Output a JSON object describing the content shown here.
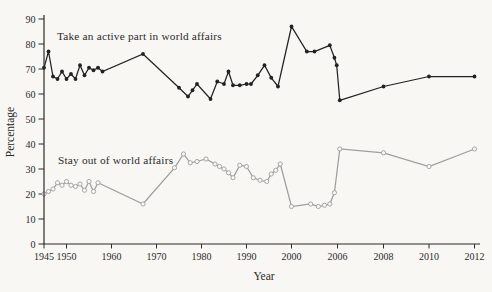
{
  "figure": {
    "background_color": "#f8f7f4",
    "axis_color": "#2b2b2b"
  },
  "chart_data": {
    "type": "line",
    "title": "",
    "xlabel": "Year",
    "ylabel": "Percentage",
    "ylim": [
      0,
      90
    ],
    "grid": false,
    "legend_position": "inline-annotations",
    "x_axis_note": "linear year spacing 1945-2000, compressed equal spacing for 2006, 2008, 2010, 2012",
    "y_ticks": [
      0,
      10,
      20,
      30,
      40,
      50,
      60,
      70,
      80,
      90
    ],
    "x_ticks": [
      1945,
      1950,
      1960,
      1970,
      1980,
      1990,
      2000,
      2006,
      2008,
      2010,
      2012
    ],
    "annotations": [
      {
        "text": "Take an active part in world affairs",
        "x": 57,
        "y": 40
      },
      {
        "text": "Stay out of world affairs",
        "x": 58,
        "y": 164
      }
    ],
    "series": [
      {
        "name": "Take an active part in world affairs",
        "color": "#222222",
        "marker": "filled-circle",
        "points": [
          [
            1945,
            70.5
          ],
          [
            1946,
            77
          ],
          [
            1947,
            67
          ],
          [
            1948,
            66
          ],
          [
            1949,
            69
          ],
          [
            1950,
            66
          ],
          [
            1951,
            68
          ],
          [
            1952,
            66
          ],
          [
            1953,
            71.5
          ],
          [
            1954,
            67.5
          ],
          [
            1955,
            70.5
          ],
          [
            1956,
            69.5
          ],
          [
            1957,
            70.5
          ],
          [
            1958,
            69
          ],
          [
            1967,
            76
          ],
          [
            1975,
            62.5
          ],
          [
            1977,
            59
          ],
          [
            1978,
            61.5
          ],
          [
            1979,
            64
          ],
          [
            1982,
            58
          ],
          [
            1983.5,
            65
          ],
          [
            1985,
            64
          ],
          [
            1986,
            69
          ],
          [
            1987,
            63.5
          ],
          [
            1988.5,
            63.5
          ],
          [
            1990,
            64
          ],
          [
            1991,
            64
          ],
          [
            1992.5,
            67.5
          ],
          [
            1994,
            71.5
          ],
          [
            1995.5,
            66.5
          ],
          [
            1997,
            63
          ],
          [
            2000,
            87
          ],
          [
            2002,
            77
          ],
          [
            2003,
            77
          ],
          [
            2005,
            79.5
          ],
          [
            2005.6,
            74.5
          ],
          [
            2005.9,
            71.5
          ],
          [
            2006.1,
            57.5
          ],
          [
            2008,
            63
          ],
          [
            2010,
            67
          ],
          [
            2012,
            67
          ]
        ]
      },
      {
        "name": "Stay out of world affairs",
        "color": "#9e9e9e",
        "marker": "open-circle",
        "points": [
          [
            1945,
            20
          ],
          [
            1946,
            21
          ],
          [
            1947,
            22
          ],
          [
            1948,
            24.5
          ],
          [
            1949,
            23.5
          ],
          [
            1950,
            25
          ],
          [
            1951,
            23.5
          ],
          [
            1952,
            23
          ],
          [
            1953,
            24
          ],
          [
            1954,
            21.5
          ],
          [
            1955,
            25
          ],
          [
            1956,
            21
          ],
          [
            1957,
            24.5
          ],
          [
            1967,
            16
          ],
          [
            1974,
            30.5
          ],
          [
            1976,
            36
          ],
          [
            1977.5,
            32.5
          ],
          [
            1979,
            33
          ],
          [
            1981,
            34
          ],
          [
            1983,
            32
          ],
          [
            1984,
            31
          ],
          [
            1985,
            30
          ],
          [
            1986,
            28.5
          ],
          [
            1987,
            26.5
          ],
          [
            1988.5,
            31.5
          ],
          [
            1990,
            31
          ],
          [
            1991.5,
            26.5
          ],
          [
            1993,
            25.5
          ],
          [
            1994.5,
            25
          ],
          [
            1995.5,
            28
          ],
          [
            1996.5,
            29.5
          ],
          [
            1997.5,
            32
          ],
          [
            2000,
            15
          ],
          [
            2002.5,
            16
          ],
          [
            2003.5,
            15
          ],
          [
            2004.3,
            15.5
          ],
          [
            2005,
            16
          ],
          [
            2005.6,
            20.5
          ],
          [
            2006.1,
            38
          ],
          [
            2008,
            36.5
          ],
          [
            2010,
            31
          ],
          [
            2012,
            38
          ]
        ]
      }
    ]
  }
}
